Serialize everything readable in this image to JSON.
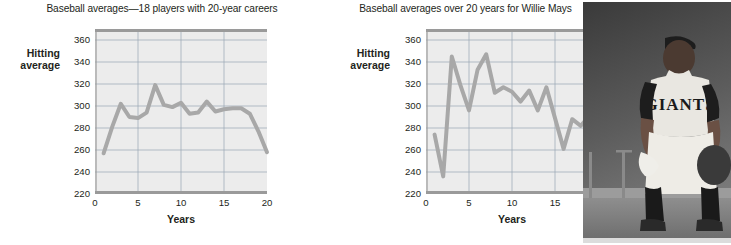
{
  "figure": {
    "panels": [
      {
        "id": "left",
        "title": "Baseball averages—18 players with 20-year careers",
        "ylabel_line1": "Hitting",
        "ylabel_line2": "average",
        "xlabel": "Years"
      },
      {
        "id": "right",
        "title": "Baseball averages over 20 years for Willie Mays",
        "ylabel_line1": "Hitting",
        "ylabel_line2": "average",
        "xlabel": "Years"
      }
    ],
    "photo": {
      "caption": "black-and-white photo of Willie Mays in Giants uniform",
      "uniform_text": "GIANTS"
    },
    "colors": {
      "plot_background": "#ececec",
      "gridline": "#9aa6b4",
      "axis": "#9a9a9a",
      "series": "#a8a8a8",
      "text": "#231f20"
    }
  },
  "chart_data": [
    {
      "type": "line",
      "title": "Baseball averages—18 players with 20-year careers",
      "xlabel": "Years",
      "ylabel": "Hitting average",
      "xlim": [
        0,
        20
      ],
      "ylim": [
        220,
        370
      ],
      "xticks": [
        0,
        5,
        10,
        15,
        20
      ],
      "yticks": [
        220,
        240,
        260,
        280,
        300,
        320,
        340,
        360
      ],
      "grid": true,
      "legend": "none",
      "x": [
        1,
        2,
        3,
        4,
        5,
        6,
        7,
        8,
        9,
        10,
        11,
        12,
        13,
        14,
        15,
        16,
        17,
        18,
        19,
        20
      ],
      "values": [
        257,
        281,
        302,
        290,
        289,
        294,
        319,
        301,
        299,
        303,
        293,
        294,
        304,
        295,
        297,
        298,
        298,
        293,
        277,
        258
      ]
    },
    {
      "type": "line",
      "title": "Baseball averages over 20 years for Willie Mays",
      "xlabel": "Years",
      "ylabel": "Hitting average",
      "xlim": [
        0,
        20
      ],
      "ylim": [
        220,
        370
      ],
      "xticks": [
        0,
        5,
        10,
        15,
        20
      ],
      "yticks": [
        220,
        240,
        260,
        280,
        300,
        320,
        340,
        360
      ],
      "grid": true,
      "legend": "none",
      "x": [
        1,
        2,
        3,
        4,
        5,
        6,
        7,
        8,
        9,
        10,
        11,
        12,
        13,
        14,
        15,
        16,
        17,
        18,
        19,
        20
      ],
      "values": [
        274,
        236,
        345,
        319,
        296,
        333,
        347,
        312,
        317,
        313,
        304,
        314,
        296,
        317,
        289,
        261,
        288,
        282,
        291,
        271
      ]
    }
  ]
}
